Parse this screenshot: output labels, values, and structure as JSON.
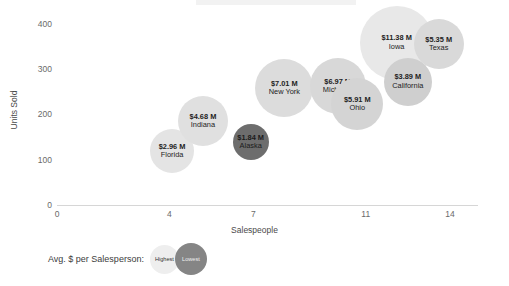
{
  "chart_data": {
    "type": "scatter",
    "title": "",
    "xlabel": "Salespeople",
    "ylabel": "Units Sold",
    "xlim": [
      0,
      15
    ],
    "ylim": [
      0,
      430
    ],
    "xticks": [
      0,
      4,
      7,
      11,
      14
    ],
    "yticks": [
      0,
      100,
      200,
      300,
      400
    ],
    "grid": false,
    "legend": {
      "title": "Avg. $ per Salesperson:",
      "position": "bottom-left",
      "entries": [
        {
          "label": "Highest",
          "color": "#eeeeee"
        },
        {
          "label": "Lowest",
          "color": "#858585"
        }
      ]
    },
    "size_encoding": "bubble area = Avg. $ per Salesperson",
    "color_encoding": "light = highest avg $, dark = lowest avg $",
    "points": [
      {
        "name": "Florida",
        "value_label": "$2.96 M",
        "avg_per_salesperson": 2.96,
        "x": 4.1,
        "y": 118,
        "radius": 22,
        "color": "#e4e4e4"
      },
      {
        "name": "Indiana",
        "value_label": "$4.68 M",
        "avg_per_salesperson": 4.68,
        "x": 5.2,
        "y": 185,
        "radius": 25,
        "color": "#e0e0e0"
      },
      {
        "name": "Alaska",
        "value_label": "$1.84 M",
        "avg_per_salesperson": 1.84,
        "x": 6.9,
        "y": 138,
        "radius": 18,
        "color": "#6d6d6d"
      },
      {
        "name": "New York",
        "value_label": "$7.01 M",
        "avg_per_salesperson": 7.01,
        "x": 8.1,
        "y": 258,
        "radius": 29,
        "color": "#dcdcdc"
      },
      {
        "name": "Michigan",
        "value_label": "$6.97 M",
        "avg_per_salesperson": 6.97,
        "x": 10.0,
        "y": 262,
        "radius": 28,
        "color": "#d8d8d8"
      },
      {
        "name": "Ohio",
        "value_label": "$5.91 M",
        "avg_per_salesperson": 5.91,
        "x": 10.7,
        "y": 222,
        "radius": 26,
        "color": "#d4d4d4"
      },
      {
        "name": "Iowa",
        "value_label": "$11.38 M",
        "avg_per_salesperson": 11.38,
        "x": 12.1,
        "y": 358,
        "radius": 37,
        "color": "#e8e8e8"
      },
      {
        "name": "California",
        "value_label": "$3.89 M",
        "avg_per_salesperson": 3.89,
        "x": 12.5,
        "y": 272,
        "radius": 24,
        "color": "#cfcfcf"
      },
      {
        "name": "Texas",
        "value_label": "$5.35 M",
        "avg_per_salesperson": 5.35,
        "x": 13.6,
        "y": 355,
        "radius": 25,
        "color": "#d9d9d9"
      }
    ]
  }
}
